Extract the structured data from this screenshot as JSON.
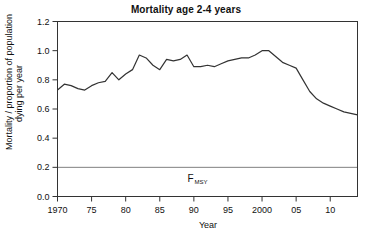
{
  "chart_data": {
    "type": "line",
    "title": "Mortality age 2-4 years",
    "xlabel": "Year",
    "ylabel_line1": "Mortality / proportion of population",
    "ylabel_line2": "dying per year",
    "xlim": [
      1970,
      2014
    ],
    "ylim": [
      0.0,
      1.2
    ],
    "grid": false,
    "legend": "none",
    "x_tick_values": [
      1970,
      1975,
      1980,
      1985,
      1990,
      1995,
      2000,
      2005,
      2010
    ],
    "x_tick_labels": [
      "1970",
      "75",
      "80",
      "85",
      "90",
      "95",
      "2000",
      "05",
      "10"
    ],
    "y_tick_values": [
      0.0,
      0.2,
      0.4,
      0.6,
      0.8,
      1.0,
      1.2
    ],
    "y_tick_labels": [
      "0.0",
      "0.2",
      "0.4",
      "0.6",
      "0.8",
      "1.0",
      "1.2"
    ],
    "series": [
      {
        "name": "Mortality",
        "color": "#333333",
        "x": [
          1970,
          1971,
          1972,
          1973,
          1974,
          1975,
          1976,
          1977,
          1978,
          1979,
          1980,
          1981,
          1982,
          1983,
          1984,
          1985,
          1986,
          1987,
          1988,
          1989,
          1990,
          1991,
          1992,
          1993,
          1994,
          1995,
          1996,
          1997,
          1998,
          1999,
          2000,
          2001,
          2002,
          2003,
          2004,
          2005,
          2006,
          2007,
          2008,
          2009,
          2010,
          2011,
          2012,
          2013,
          2014
        ],
        "values": [
          0.73,
          0.77,
          0.76,
          0.74,
          0.73,
          0.76,
          0.78,
          0.79,
          0.85,
          0.8,
          0.84,
          0.87,
          0.97,
          0.95,
          0.9,
          0.87,
          0.94,
          0.93,
          0.94,
          0.97,
          0.89,
          0.89,
          0.9,
          0.89,
          0.91,
          0.93,
          0.94,
          0.95,
          0.95,
          0.97,
          1.0,
          1.0,
          0.96,
          0.92,
          0.9,
          0.88,
          0.8,
          0.72,
          0.67,
          0.64,
          0.62,
          0.6,
          0.58,
          0.57,
          0.56
        ]
      }
    ],
    "reference_lines": [
      {
        "name": "F_MSY",
        "label_main": "F",
        "label_sub": "MSY",
        "value": 0.2,
        "orientation": "horizontal",
        "color": "#808080"
      }
    ]
  }
}
